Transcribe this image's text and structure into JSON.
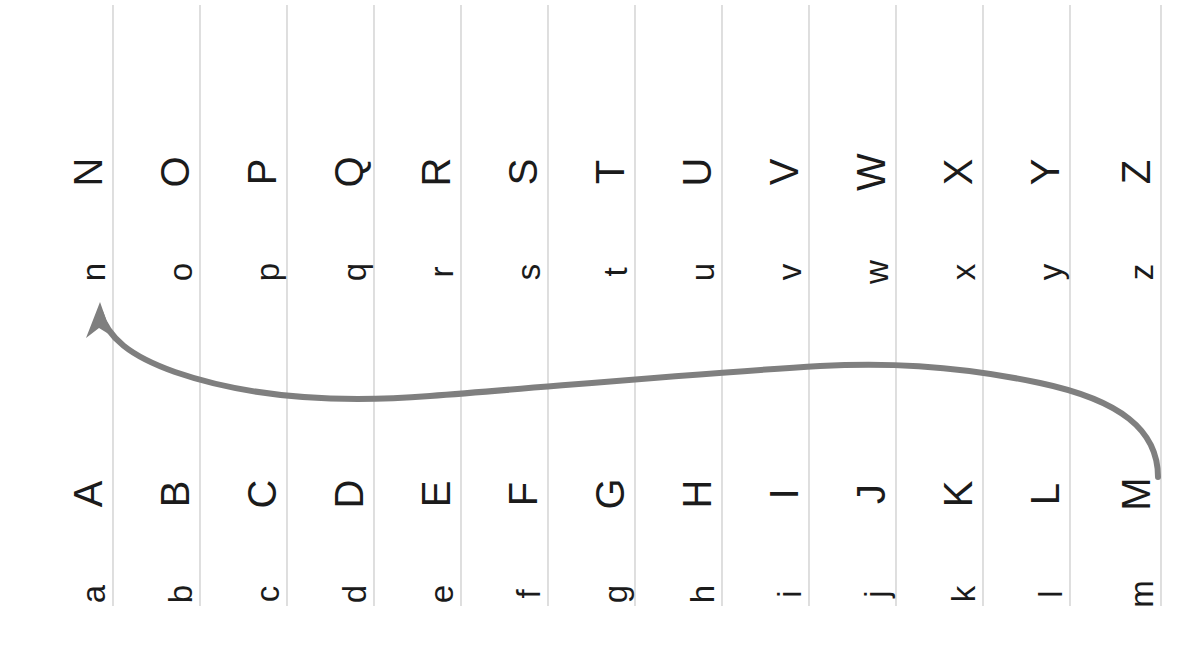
{
  "figure": {
    "orientation": "rotated-90-ccw",
    "background_color": "#ffffff",
    "grid_line_color": "#c9c9c9",
    "curve_color": "#7f7f7f",
    "letter_color": "#1b1b1b"
  },
  "columns": [
    {
      "index": 1,
      "x": 113,
      "upper_top": "N",
      "lower_top": "n",
      "upper_bottom": "A",
      "lower_bottom": "a"
    },
    {
      "index": 2,
      "x": 200,
      "upper_top": "O",
      "lower_top": "o",
      "upper_bottom": "B",
      "lower_bottom": "b"
    },
    {
      "index": 3,
      "x": 287,
      "upper_top": "P",
      "lower_top": "p",
      "upper_bottom": "C",
      "lower_bottom": "c"
    },
    {
      "index": 4,
      "x": 374,
      "upper_top": "Q",
      "lower_top": "q",
      "upper_bottom": "D",
      "lower_bottom": "d"
    },
    {
      "index": 5,
      "x": 461,
      "upper_top": "R",
      "lower_top": "r",
      "upper_bottom": "E",
      "lower_bottom": "e"
    },
    {
      "index": 6,
      "x": 548,
      "upper_top": "S",
      "lower_top": "s",
      "upper_bottom": "F",
      "lower_bottom": "f"
    },
    {
      "index": 7,
      "x": 635,
      "upper_top": "T",
      "lower_top": "t",
      "upper_bottom": "G",
      "lower_bottom": "g"
    },
    {
      "index": 8,
      "x": 722,
      "upper_top": "U",
      "lower_top": "u",
      "upper_bottom": "H",
      "lower_bottom": "h"
    },
    {
      "index": 9,
      "x": 809,
      "upper_top": "V",
      "lower_top": "v",
      "upper_bottom": "I",
      "lower_bottom": "i"
    },
    {
      "index": 10,
      "x": 896,
      "upper_top": "W",
      "lower_top": "w",
      "upper_bottom": "J",
      "lower_bottom": "j"
    },
    {
      "index": 11,
      "x": 983,
      "upper_top": "X",
      "lower_top": "x",
      "upper_bottom": "K",
      "lower_bottom": "k"
    },
    {
      "index": 12,
      "x": 1070,
      "upper_top": "Y",
      "lower_top": "y",
      "upper_bottom": "L",
      "lower_bottom": "l"
    },
    {
      "index": 13,
      "x": 1161,
      "upper_top": "Z",
      "lower_top": "z",
      "upper_bottom": "M",
      "lower_bottom": "m"
    }
  ],
  "rows": {
    "upper_top_y": 172,
    "lower_top_y": 272,
    "upper_bottom_y": 494,
    "lower_bottom_y": 594
  },
  "grid": {
    "line_top_y": 5,
    "line_bottom_y": 606,
    "count": 13
  },
  "arrow": {
    "name": "curved-arrow",
    "from_label": "M",
    "to_label": "n",
    "path": "M 1158 477 C 1158 430 1120 400 1040 383 C 950 364 880 363 820 366 C 700 373 560 386 430 396 C 340 403 250 398 175 372 C 130 356 108 338 100 312",
    "head_points": "100,302 112,336 99,328 86,338",
    "stroke_width": 6
  }
}
